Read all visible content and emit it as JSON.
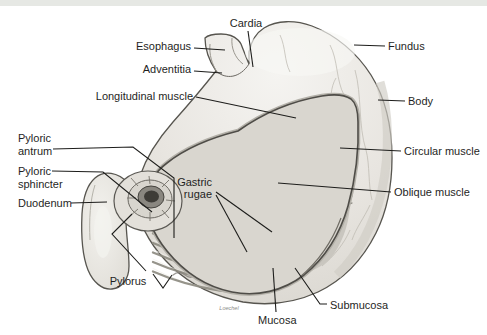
{
  "figure": {
    "credit_signature": "Loechel",
    "colors": {
      "top_bar": "#e6e8e4",
      "background": "#ffffff",
      "leader_line": "#1d1d1b",
      "label_text": "#1f1f1e",
      "organ_outline": "#57554f"
    },
    "labels": {
      "cardia": "Cardia",
      "esophagus": "Esophagus",
      "adventitia": "Adventitia",
      "longitudinal_muscle": "Longitudinal muscle",
      "fundus": "Fundus",
      "body": "Body",
      "circular_muscle": "Circular muscle",
      "oblique_muscle": "Oblique muscle",
      "pyloric_antrum": {
        "line1": "Pyloric",
        "line2": "antrum"
      },
      "pyloric_sphincter": {
        "line1": "Pyloric",
        "line2": "sphincter"
      },
      "duodenum": "Duodenum",
      "gastric_rugae": {
        "line1": "Gastric",
        "line2": "rugae"
      },
      "pylorus": "Pylorus",
      "submucosa": "Submucosa",
      "mucosa": "Mucosa"
    }
  }
}
